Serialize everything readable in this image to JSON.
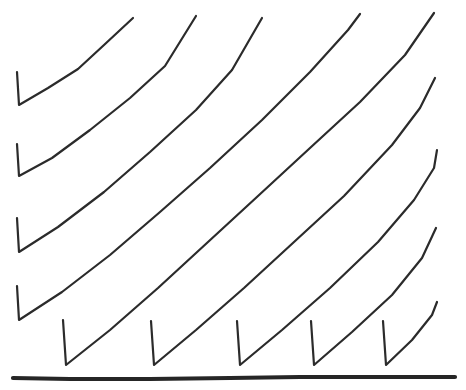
{
  "figure": {
    "style": "hand-drawn ink line drawing",
    "background_color": "#ffffff",
    "canvas": {
      "width": 466,
      "height": 390
    }
  },
  "chart_data": {
    "type": "line",
    "subtitle": "",
    "xlabel": "",
    "ylabel": "",
    "xlim": [
      0,
      466
    ],
    "ylim": [
      390,
      0
    ],
    "grid": false,
    "legend": null,
    "annotations": [],
    "tick_labels": {
      "x": [],
      "y": []
    },
    "stroke_color": "#2b2b2b",
    "stroke_width": 2.2,
    "baseline": {
      "name": "baseline-axis",
      "color": "#262626",
      "width": 4.2,
      "points": [
        [
          13,
          378
        ],
        [
          70,
          379
        ],
        [
          150,
          379
        ],
        [
          230,
          378
        ],
        [
          300,
          377
        ],
        [
          380,
          377
        ],
        [
          455,
          377
        ]
      ]
    },
    "series": [
      {
        "name": "ramp-1",
        "group": "left-edge",
        "drop": [
          [
            17,
            72
          ],
          [
            19,
            105
          ]
        ],
        "points": [
          [
            19,
            105
          ],
          [
            48,
            88
          ],
          [
            78,
            69
          ],
          [
            104,
            45
          ],
          [
            133,
            18
          ]
        ]
      },
      {
        "name": "ramp-2",
        "group": "left-edge",
        "drop": [
          [
            17,
            144
          ],
          [
            19,
            176
          ]
        ],
        "points": [
          [
            19,
            176
          ],
          [
            52,
            158
          ],
          [
            90,
            130
          ],
          [
            130,
            98
          ],
          [
            165,
            66
          ],
          [
            196,
            16
          ]
        ]
      },
      {
        "name": "ramp-3",
        "group": "left-edge",
        "drop": [
          [
            17,
            218
          ],
          [
            19,
            252
          ]
        ],
        "points": [
          [
            19,
            252
          ],
          [
            58,
            227
          ],
          [
            104,
            192
          ],
          [
            150,
            152
          ],
          [
            196,
            110
          ],
          [
            232,
            70
          ],
          [
            262,
            18
          ]
        ]
      },
      {
        "name": "ramp-4",
        "group": "left-edge",
        "drop": [
          [
            17,
            286
          ],
          [
            19,
            320
          ]
        ],
        "points": [
          [
            19,
            320
          ],
          [
            62,
            292
          ],
          [
            110,
            255
          ],
          [
            160,
            212
          ],
          [
            210,
            168
          ],
          [
            262,
            120
          ],
          [
            310,
            72
          ],
          [
            348,
            30
          ],
          [
            360,
            14
          ]
        ]
      },
      {
        "name": "ramp-5",
        "group": "bottom-edge",
        "drop": [
          [
            63,
            320
          ],
          [
            66,
            365
          ]
        ],
        "points": [
          [
            66,
            365
          ],
          [
            110,
            330
          ],
          [
            158,
            288
          ],
          [
            208,
            242
          ],
          [
            258,
            196
          ],
          [
            310,
            148
          ],
          [
            360,
            102
          ],
          [
            405,
            55
          ],
          [
            434,
            13
          ]
        ]
      },
      {
        "name": "ramp-6",
        "group": "bottom-edge",
        "drop": [
          [
            151,
            321
          ],
          [
            154,
            365
          ]
        ],
        "points": [
          [
            154,
            365
          ],
          [
            196,
            330
          ],
          [
            244,
            288
          ],
          [
            294,
            242
          ],
          [
            344,
            196
          ],
          [
            392,
            145
          ],
          [
            420,
            108
          ],
          [
            435,
            78
          ]
        ]
      },
      {
        "name": "ramp-7",
        "group": "bottom-edge",
        "drop": [
          [
            237,
            321
          ],
          [
            240,
            365
          ]
        ],
        "points": [
          [
            240,
            365
          ],
          [
            282,
            330
          ],
          [
            330,
            288
          ],
          [
            378,
            242
          ],
          [
            414,
            200
          ],
          [
            434,
            168
          ],
          [
            437,
            150
          ]
        ]
      },
      {
        "name": "ramp-8",
        "group": "bottom-edge",
        "drop": [
          [
            311,
            321
          ],
          [
            314,
            365
          ]
        ],
        "points": [
          [
            314,
            365
          ],
          [
            352,
            332
          ],
          [
            392,
            295
          ],
          [
            422,
            258
          ],
          [
            436,
            228
          ]
        ]
      },
      {
        "name": "ramp-9",
        "group": "bottom-edge",
        "drop": [
          [
            383,
            321
          ],
          [
            386,
            365
          ]
        ],
        "points": [
          [
            386,
            365
          ],
          [
            412,
            340
          ],
          [
            432,
            315
          ],
          [
            437,
            302
          ]
        ]
      }
    ]
  }
}
